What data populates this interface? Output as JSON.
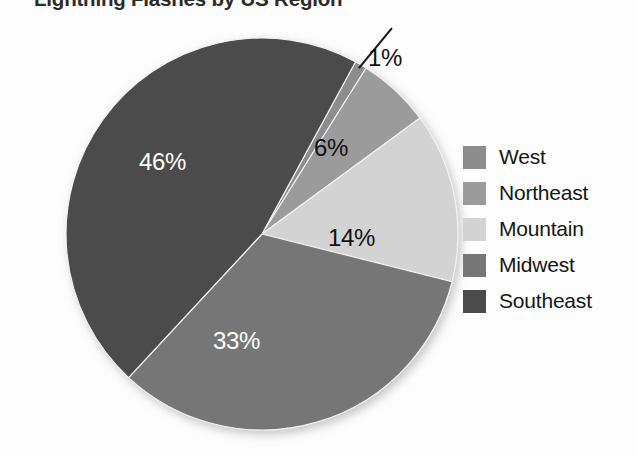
{
  "chart_data": {
    "type": "pie",
    "title": "Lightning Flashes by US Region",
    "xlabel": "",
    "ylabel": "",
    "legend_position": "right",
    "grid": false,
    "categories": [
      "West",
      "Northeast",
      "Mountain",
      "Midwest",
      "Southeast"
    ],
    "values": [
      1,
      6,
      14,
      33,
      46
    ],
    "value_labels": [
      "1%",
      "6%",
      "14%",
      "33%",
      "46%"
    ],
    "units": "percent",
    "colors": [
      "#8d8d8d",
      "#9b9b9b",
      "#d3d3d3",
      "#767676",
      "#4b4b4b"
    ],
    "slices": [
      {
        "name": "West",
        "value": 1,
        "label": "1%",
        "color": "#8d8d8d",
        "label_color": "#111111",
        "label_placement": "outside",
        "leader_line": true
      },
      {
        "name": "Northeast",
        "value": 6,
        "label": "6%",
        "color": "#9b9b9b",
        "label_color": "#111111",
        "label_placement": "inside",
        "leader_line": false
      },
      {
        "name": "Mountain",
        "value": 14,
        "label": "14%",
        "color": "#d3d3d3",
        "label_color": "#111111",
        "label_placement": "inside",
        "leader_line": false
      },
      {
        "name": "Midwest",
        "value": 33,
        "label": "33%",
        "color": "#767676",
        "label_color": "#ffffff",
        "label_placement": "inside",
        "leader_line": false
      },
      {
        "name": "Southeast",
        "value": 46,
        "label": "46%",
        "color": "#4b4b4b",
        "label_color": "#ffffff",
        "label_placement": "inside",
        "leader_line": false
      }
    ]
  },
  "legend": {
    "items": [
      {
        "label": "West",
        "color": "#8d8d8d"
      },
      {
        "label": "Northeast",
        "color": "#9b9b9b"
      },
      {
        "label": "Mountain",
        "color": "#d3d3d3"
      },
      {
        "label": "Midwest",
        "color": "#767676"
      },
      {
        "label": "Southeast",
        "color": "#4b4b4b"
      }
    ]
  }
}
